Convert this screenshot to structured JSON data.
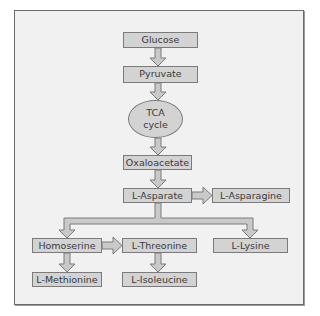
{
  "diagram": {
    "type": "metabolic pathway flowchart",
    "nodes": {
      "glucose": "Glucose",
      "pyruvate": "Pyruvate",
      "tca_line1": "TCA",
      "tca_line2": "cycle",
      "oxaloacetate": "Oxaloacetate",
      "l_asparate": "L-Asparate",
      "l_asparagine": "L-Asparagine",
      "homoserine": "Homoserine",
      "l_threonine": "L-Threonine",
      "l_lysine": "L-Lysine",
      "l_methionine": "L-Methionine",
      "l_isoleucine": "L-Isoleucine"
    },
    "edges": [
      [
        "Glucose",
        "Pyruvate"
      ],
      [
        "Pyruvate",
        "TCA cycle"
      ],
      [
        "TCA cycle",
        "Oxaloacetate"
      ],
      [
        "Oxaloacetate",
        "L-Asparate"
      ],
      [
        "L-Asparate",
        "L-Asparagine"
      ],
      [
        "L-Asparate",
        "Homoserine"
      ],
      [
        "L-Asparate",
        "L-Lysine"
      ],
      [
        "Homoserine",
        "L-Threonine"
      ],
      [
        "Homoserine",
        "L-Methionine"
      ],
      [
        "L-Threonine",
        "L-Isoleucine"
      ]
    ],
    "colors": {
      "node_fill": "#d3d3d3",
      "node_border": "#7b7b7b",
      "panel_bg": "#f1f1f1",
      "text": "#3a3a3a"
    }
  }
}
